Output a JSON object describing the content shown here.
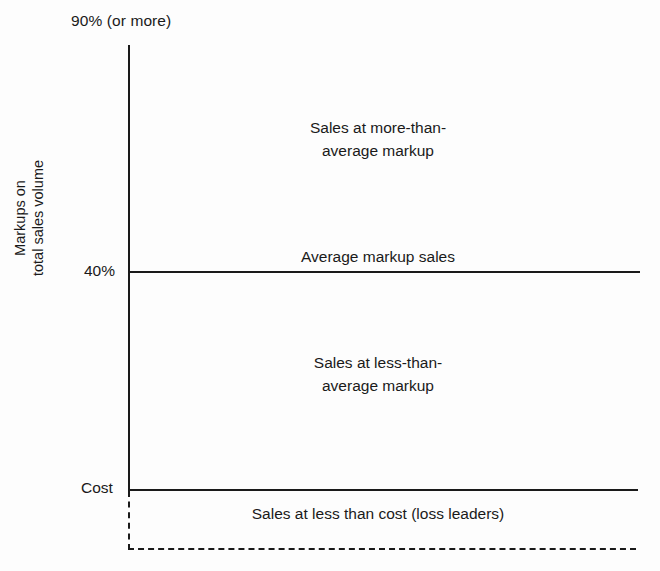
{
  "chart_data": {
    "type": "bar",
    "title": "",
    "subtitle": "",
    "xlabel": "",
    "ylabel": "Markups on total sales volume",
    "ylabel_lines": [
      "Markups on",
      "total sales volume"
    ],
    "axis": {
      "y_tick_labels": [
        "90% (or more)",
        "40%",
        "Cost"
      ],
      "y_tick_values": [
        90,
        40,
        0
      ],
      "grid": false,
      "x_axis_style": "dashed",
      "y_axis_style": "solid-above-cost-dashed-below"
    },
    "categories": [
      "Sales at more-than-average markup",
      "Average markup sales",
      "Sales at less-than-average markup",
      "Sales at less than cost (loss leaders)"
    ],
    "values": [
      90,
      40,
      40,
      0
    ],
    "bands": [
      {
        "name": "above-average-markup",
        "label_lines": [
          "Sales at more-than-",
          "average markup"
        ],
        "range_top": "90% (or more)",
        "range_bottom": "40%"
      },
      {
        "name": "average-markup",
        "label_lines": [
          "Average markup sales"
        ],
        "range_top": "40%",
        "range_bottom": "40%"
      },
      {
        "name": "below-average-markup",
        "label_lines": [
          "Sales at less-than-",
          "average markup"
        ],
        "range_top": "40%",
        "range_bottom": "Cost"
      },
      {
        "name": "below-cost",
        "label_lines": [
          "Sales at less than cost (loss leaders)"
        ],
        "range_top": "Cost",
        "range_bottom": ""
      }
    ],
    "legend": [],
    "annotations": [
      "90% (or more)",
      "40%",
      "Cost",
      "Sales at more-than-average markup",
      "Average markup sales",
      "Sales at less-than-average markup",
      "Sales at less than cost (loss leaders)"
    ],
    "colors": {
      "ink": "#1a1a1a",
      "background": "#fdfdfd"
    }
  },
  "ticks": {
    "top": "90% (or more)",
    "middle": "40%",
    "bottom": "Cost"
  },
  "ylabel": {
    "line1": "Markups on",
    "line2": "total sales volume"
  },
  "bands": {
    "top": {
      "line1": "Sales at more-than-",
      "line2": "average markup"
    },
    "middle": {
      "line1": "Average markup sales"
    },
    "lower": {
      "line1": "Sales at less-than-",
      "line2": "average markup"
    },
    "bottom": {
      "line1": "Sales at less than cost (loss leaders)"
    }
  }
}
